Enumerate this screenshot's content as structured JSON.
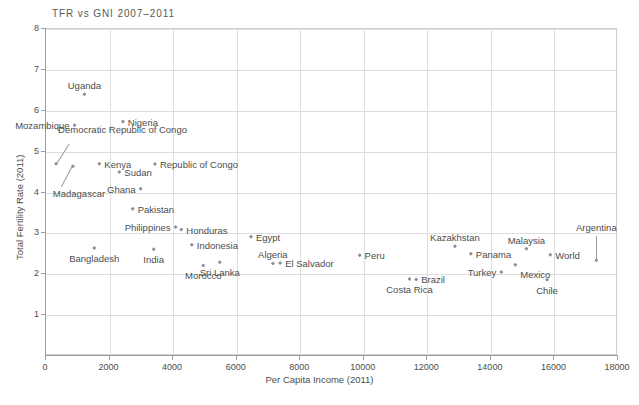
{
  "chart_data": {
    "type": "scatter",
    "title": "TFR vs GNI 2007–2011",
    "xlabel": "Per Capita Income (2011)",
    "ylabel": "Total Fertility Rate (2011)",
    "xlim": [
      0,
      18000
    ],
    "ylim": [
      0,
      8
    ],
    "xticks": [
      "0",
      "2000",
      "4000",
      "6000",
      "8000",
      "10000",
      "12000",
      "14000",
      "16000",
      "18000"
    ],
    "yticks": [
      "1",
      "2",
      "3",
      "4",
      "5",
      "6",
      "7",
      "8"
    ],
    "grid": true,
    "legend": "none",
    "marker_color": "#8c8c99",
    "points": [
      {
        "name": "Uganda",
        "x": 1240,
        "y": 6.38,
        "label_pos": "above"
      },
      {
        "name": "Mozambique",
        "x": 930,
        "y": 5.62,
        "label_pos": "left"
      },
      {
        "name": "Nigeria",
        "x": 2450,
        "y": 5.71,
        "label_pos": "right"
      },
      {
        "name": "Democratic Republic of Congo",
        "x": 350,
        "y": 4.68,
        "label_pos": "leader-up"
      },
      {
        "name": "Madagascar",
        "x": 880,
        "y": 4.62,
        "label_pos": "leader-down"
      },
      {
        "name": "Kenya",
        "x": 1710,
        "y": 4.68,
        "label_pos": "right"
      },
      {
        "name": "Republic of Congo",
        "x": 3460,
        "y": 4.67,
        "label_pos": "right"
      },
      {
        "name": "Sudan",
        "x": 2340,
        "y": 4.48,
        "label_pos": "right"
      },
      {
        "name": "Ghana",
        "x": 3010,
        "y": 4.07,
        "label_pos": "left"
      },
      {
        "name": "Pakistan",
        "x": 2760,
        "y": 3.58,
        "label_pos": "right"
      },
      {
        "name": "Philippines",
        "x": 4110,
        "y": 3.13,
        "label_pos": "left"
      },
      {
        "name": "Honduras",
        "x": 4290,
        "y": 3.07,
        "label_pos": "right"
      },
      {
        "name": "Egypt",
        "x": 6480,
        "y": 2.89,
        "label_pos": "right"
      },
      {
        "name": "Indonesia",
        "x": 4620,
        "y": 2.7,
        "label_pos": "right"
      },
      {
        "name": "Bangladesh",
        "x": 1550,
        "y": 2.62,
        "label_pos": "below"
      },
      {
        "name": "India",
        "x": 3420,
        "y": 2.59,
        "label_pos": "below"
      },
      {
        "name": "Kazakhstan",
        "x": 12900,
        "y": 2.66,
        "label_pos": "above"
      },
      {
        "name": "Malaysia",
        "x": 15150,
        "y": 2.6,
        "label_pos": "above"
      },
      {
        "name": "Morocco",
        "x": 4980,
        "y": 2.19,
        "label_pos": "below"
      },
      {
        "name": "Sri Lanka",
        "x": 5500,
        "y": 2.27,
        "label_pos": "below"
      },
      {
        "name": "Algeria",
        "x": 7170,
        "y": 2.24,
        "label_pos": "above"
      },
      {
        "name": "El Salvador",
        "x": 7400,
        "y": 2.25,
        "label_pos": "right"
      },
      {
        "name": "Peru",
        "x": 9900,
        "y": 2.44,
        "label_pos": "right"
      },
      {
        "name": "Panama",
        "x": 13400,
        "y": 2.48,
        "label_pos": "right"
      },
      {
        "name": "World",
        "x": 15900,
        "y": 2.45,
        "label_pos": "right"
      },
      {
        "name": "Costa Rica",
        "x": 11470,
        "y": 1.86,
        "label_pos": "below"
      },
      {
        "name": "Brazil",
        "x": 11680,
        "y": 1.85,
        "label_pos": "right"
      },
      {
        "name": "Turkey",
        "x": 14360,
        "y": 2.03,
        "label_pos": "left"
      },
      {
        "name": "Mexico",
        "x": 14800,
        "y": 2.21,
        "label_pos": "below-right"
      },
      {
        "name": "Chile",
        "x": 15800,
        "y": 1.84,
        "label_pos": "below"
      },
      {
        "name": "Argentina",
        "x": 17350,
        "y": 2.32,
        "label_pos": "leader-above"
      }
    ]
  }
}
